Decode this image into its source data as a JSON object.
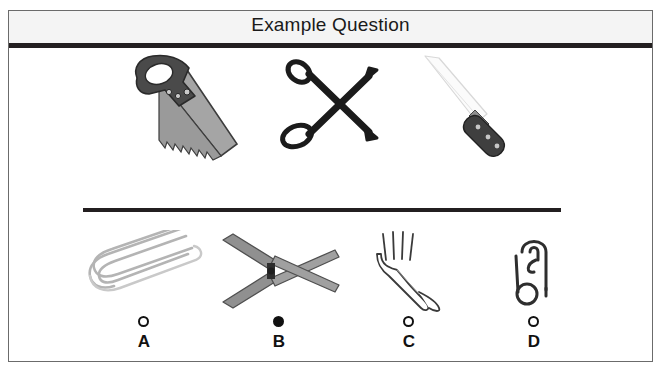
{
  "card": {
    "title": "Example Question"
  },
  "stem": {
    "items": [
      {
        "name": "handsaw",
        "alt": "hand saw"
      },
      {
        "name": "scissors",
        "alt": "scissors"
      },
      {
        "name": "knife",
        "alt": "kitchen knife"
      }
    ]
  },
  "options": [
    {
      "key": "A",
      "label": "A",
      "name": "paper-clip",
      "selected": false
    },
    {
      "key": "B",
      "label": "B",
      "name": "hedge-shears",
      "selected": true
    },
    {
      "key": "C",
      "label": "C",
      "name": "fork",
      "selected": false
    },
    {
      "key": "D",
      "label": "D",
      "name": "safety-pin",
      "selected": false
    }
  ],
  "colors": {
    "ink": "#231f20",
    "header_bg": "#f4f4f4",
    "card_border": "#6b6b6b",
    "metal_light": "#b9b9b9",
    "metal_mid": "#8d8d8d",
    "metal_dark": "#4a4a4a",
    "outline": "#555555",
    "selected_fill": "#111111"
  }
}
